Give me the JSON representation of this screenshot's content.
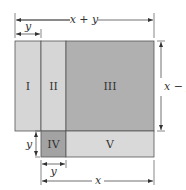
{
  "diagram": {
    "regions": [
      {
        "id": "I",
        "label": "I",
        "color": "#d6d6d6"
      },
      {
        "id": "II",
        "label": "II",
        "color": "#d6d6d6"
      },
      {
        "id": "III",
        "label": "III",
        "color": "#b0b0b0"
      },
      {
        "id": "IV",
        "label": "IV",
        "color": "#a3a3a3"
      },
      {
        "id": "V",
        "label": "V",
        "color": "#d9d9d9"
      }
    ],
    "dimensions": {
      "top_width": "x + y",
      "top_left": "y",
      "right_height": "x − y",
      "left_bottom_height": "y",
      "bottom_short": "y",
      "bottom_long": "x"
    }
  }
}
